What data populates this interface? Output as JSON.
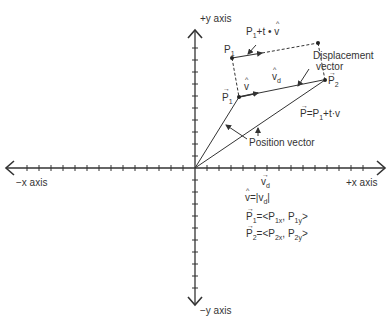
{
  "axes": {
    "pos_y_label": "+y axis",
    "neg_y_label": "−y axis",
    "pos_x_label": "+x axis",
    "neg_x_label": "−x axis",
    "origin": [
      195,
      168
    ],
    "tick_spacing": 12
  },
  "points": {
    "p1_top": {
      "label": "P",
      "sub": "1"
    },
    "p1": {
      "label": "P",
      "sub": "1",
      "vector": true
    },
    "p2": {
      "label": "P",
      "sub": "2",
      "vector": true
    }
  },
  "labels": {
    "p1_plus_tv": {
      "main": "P",
      "sub": "1",
      "rest": "+t • v"
    },
    "v_hat": "v",
    "v_d": {
      "main": "v",
      "sub": "d"
    },
    "displacement_1": "Displacement",
    "displacement_2": "vector",
    "p_eq": {
      "lhs": "P=P",
      "sub": "1",
      "rest": "+t·v"
    },
    "position_vector": "Position vector",
    "vd_below": {
      "main": "v",
      "sub": "d"
    },
    "v_hat_eq": {
      "lhs": "v=|v",
      "sub": "d",
      "rest": "|"
    },
    "p1_components": {
      "lhs": "P",
      "lsub": "1",
      "mid": "=<P",
      "s1": "1x",
      "comma": ", P",
      "s2": "1y",
      "end": ">"
    },
    "p2_components": {
      "lhs": "P",
      "lsub": "2",
      "mid": "=<P",
      "s1": "2x",
      "comma": ", P",
      "s2": "2y",
      "end": ">"
    }
  },
  "colors": {
    "stroke": "#333333",
    "background": "#ffffff"
  }
}
